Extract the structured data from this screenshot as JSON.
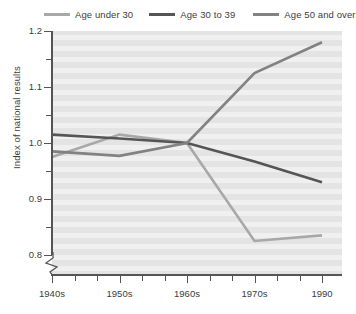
{
  "chart_data": {
    "type": "line",
    "title": "",
    "xlabel": "",
    "ylabel": "Index of national results",
    "x": [
      "1940s",
      "1950s",
      "1960s",
      "1970s",
      "1990"
    ],
    "tick_labels": {
      "x": [
        "1940s",
        "1950s",
        "1960s",
        "1970s",
        "1990"
      ],
      "y": [
        "1.2",
        "1.1",
        "1.0",
        "0.9",
        "0.8"
      ]
    },
    "ylim": [
      0.8,
      1.2
    ],
    "y_major_ticks": [
      1.2,
      1.1,
      1.0,
      0.9,
      0.8
    ],
    "y_minor_ticks": [
      1.15,
      1.05,
      0.95,
      0.85
    ],
    "grid": "horizontal-bands",
    "axis_break": "y-axis broken below 0.8",
    "legend_position": "top",
    "series": [
      {
        "name": "Age under 30",
        "color": "#a8a8a8",
        "values": [
          0.975,
          1.015,
          1.0,
          0.825,
          0.835
        ]
      },
      {
        "name": "Age 30 to 39",
        "color": "#555555",
        "values": [
          1.015,
          1.008,
          1.0,
          0.967,
          0.93
        ]
      },
      {
        "name": "Age 50 and over",
        "color": "#828282",
        "values": [
          0.985,
          0.977,
          1.0,
          1.125,
          1.18
        ]
      }
    ]
  },
  "legend": {
    "items": [
      {
        "label": "Age under 30"
      },
      {
        "label": "Age 30 to 39"
      },
      {
        "label": "Age 50 and over"
      }
    ]
  },
  "axis": {
    "y_title": "Index of national results",
    "y_labels": [
      "1.2",
      "1.1",
      "1.0",
      "0.9",
      "0.8"
    ],
    "x_labels": [
      "1940s",
      "1950s",
      "1960s",
      "1970s",
      "1990"
    ]
  },
  "colors": {
    "series_light": "#a8a8a8",
    "series_dark": "#555555",
    "series_medium": "#828282",
    "plot_background": "#e4e4e4",
    "band": "#f2f2f2",
    "axis": "#555555",
    "text": "#3d3d3d"
  }
}
